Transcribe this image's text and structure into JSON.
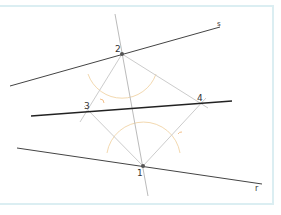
{
  "diagram": {
    "colors": {
      "frame_border": "#dbeef2",
      "main_line": "#333333",
      "construction_line": "#bbbbbb",
      "arc": "#f3d9b0",
      "point": "#555555"
    },
    "points": [
      {
        "label": "1",
        "x": 143,
        "y": 166
      },
      {
        "label": "2",
        "x": 122,
        "y": 54
      },
      {
        "label": "3",
        "x": 89,
        "y": 111
      },
      {
        "label": "4",
        "x": 201,
        "y": 103
      }
    ],
    "lines": [
      {
        "label": "s",
        "x1": 10,
        "y1": 86,
        "x2": 220,
        "y2": 27
      },
      {
        "label": "r",
        "x1": 17,
        "y1": 148,
        "x2": 262,
        "y2": 184
      },
      {
        "label": "",
        "x1": 31,
        "y1": 116,
        "x2": 232,
        "y2": 101
      }
    ],
    "labels": {
      "p1": "1",
      "p2": "2",
      "p3": "3",
      "p4": "4",
      "s": "s",
      "r": "r"
    }
  }
}
